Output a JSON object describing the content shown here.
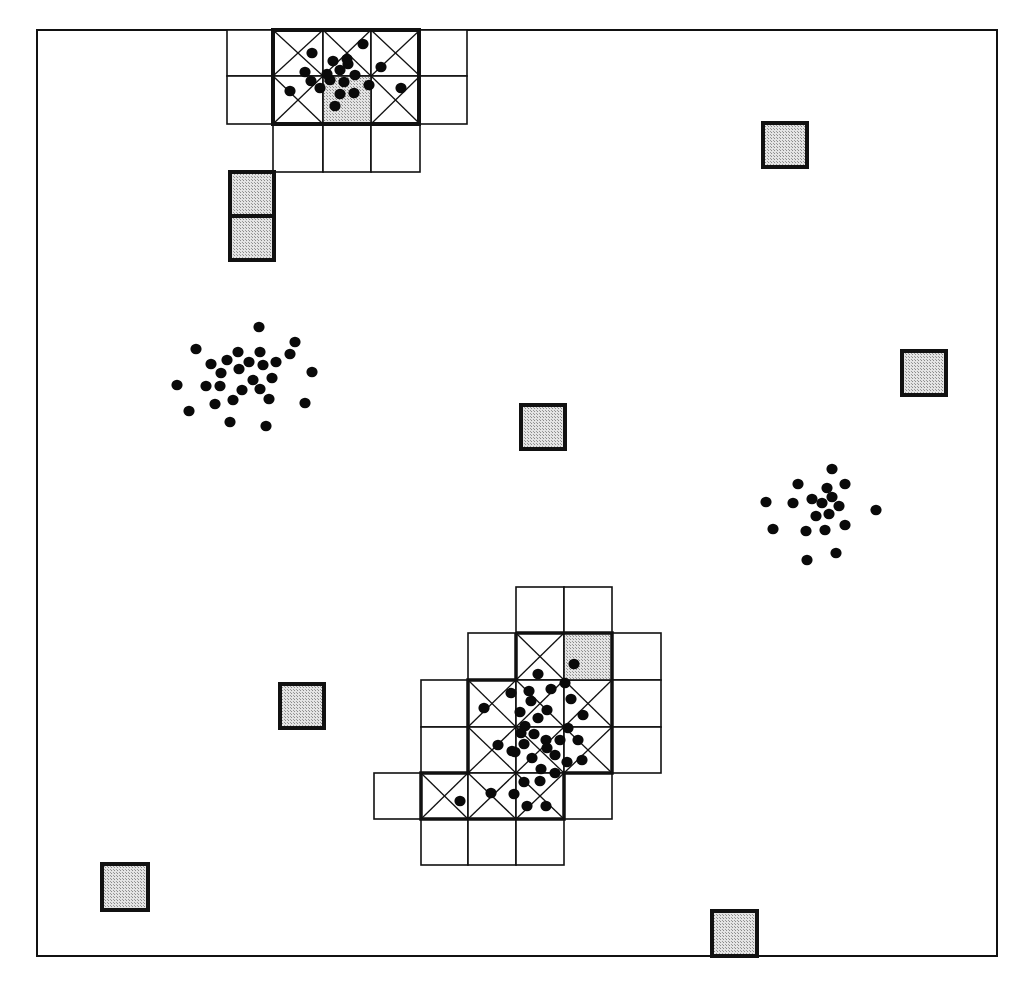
{
  "figure": {
    "type": "spatial grid clustering diagram",
    "frame": {
      "x": 37,
      "y": 30,
      "width": 960,
      "height": 926
    },
    "cell_size": 47,
    "colors": {
      "line": "#111111",
      "shaded_fill": "#c8c8c8",
      "dot": "#0a0a0a",
      "background": "#ffffff"
    },
    "legend_semantics": {
      "plain_cell": "neighbor grid cell",
      "crossed_cell": "dense cell (marked with X)",
      "shaded_cell": "shaded cell",
      "dot": "data point"
    }
  },
  "top_grid": {
    "plain_cells": [
      [
        227,
        30
      ],
      [
        227,
        76
      ],
      [
        420,
        30
      ],
      [
        420,
        76
      ],
      [
        273,
        124
      ],
      [
        323,
        124
      ],
      [
        371,
        124
      ]
    ],
    "crossed_cells": [
      [
        273,
        30
      ],
      [
        323,
        30
      ],
      [
        371,
        30
      ],
      [
        273,
        76
      ],
      [
        371,
        76
      ]
    ],
    "shaded_cells": [
      [
        323,
        76
      ]
    ],
    "cell_w": [
      46,
      50,
      48,
      49,
      47
    ],
    "thick_region": {
      "x": 273,
      "y": 30,
      "w": 146,
      "h": 94
    }
  },
  "bottom_grid": {
    "plain_cells": [
      [
        516,
        587
      ],
      [
        564,
        587
      ],
      [
        468,
        633
      ],
      [
        612,
        633
      ],
      [
        421,
        680
      ],
      [
        612,
        680
      ],
      [
        421,
        727
      ],
      [
        612,
        727
      ],
      [
        374,
        773
      ],
      [
        564,
        773
      ],
      [
        421,
        819
      ],
      [
        468,
        819
      ],
      [
        516,
        819
      ]
    ],
    "crossed_cells": [
      [
        516,
        633
      ],
      [
        468,
        680
      ],
      [
        516,
        680
      ],
      [
        564,
        680
      ],
      [
        468,
        727
      ],
      [
        516,
        727
      ],
      [
        564,
        727
      ],
      [
        421,
        773
      ],
      [
        468,
        773
      ],
      [
        516,
        773
      ]
    ],
    "shaded_cells": [
      [
        564,
        633
      ]
    ]
  },
  "isolated_shaded_squares": [
    {
      "x": 230,
      "y": 172,
      "size": 44
    },
    {
      "x": 230,
      "y": 216,
      "size": 44
    },
    {
      "x": 763,
      "y": 123,
      "size": 44
    },
    {
      "x": 902,
      "y": 351,
      "size": 44
    },
    {
      "x": 521,
      "y": 405,
      "size": 44
    },
    {
      "x": 280,
      "y": 684,
      "size": 44
    },
    {
      "x": 102,
      "y": 864,
      "size": 46
    },
    {
      "x": 712,
      "y": 911,
      "size": 45
    }
  ],
  "clusters": [
    {
      "name": "top-cluster",
      "points": [
        [
          312,
          53
        ],
        [
          363,
          44
        ],
        [
          305,
          72
        ],
        [
          333,
          61
        ],
        [
          348,
          64
        ],
        [
          340,
          70
        ],
        [
          381,
          67
        ],
        [
          355,
          75
        ],
        [
          330,
          80
        ],
        [
          369,
          85
        ],
        [
          311,
          81
        ],
        [
          320,
          88
        ],
        [
          290,
          91
        ],
        [
          340,
          94
        ],
        [
          354,
          93
        ],
        [
          401,
          88
        ],
        [
          335,
          106
        ],
        [
          344,
          82
        ],
        [
          327,
          74
        ],
        [
          347,
          59
        ]
      ]
    },
    {
      "name": "left-cluster",
      "points": [
        [
          259,
          327
        ],
        [
          196,
          349
        ],
        [
          295,
          342
        ],
        [
          238,
          352
        ],
        [
          260,
          352
        ],
        [
          227,
          360
        ],
        [
          211,
          364
        ],
        [
          249,
          362
        ],
        [
          290,
          354
        ],
        [
          276,
          362
        ],
        [
          221,
          373
        ],
        [
          239,
          369
        ],
        [
          263,
          365
        ],
        [
          312,
          372
        ],
        [
          177,
          385
        ],
        [
          206,
          386
        ],
        [
          220,
          386
        ],
        [
          253,
          380
        ],
        [
          272,
          378
        ],
        [
          242,
          390
        ],
        [
          260,
          389
        ],
        [
          189,
          411
        ],
        [
          215,
          404
        ],
        [
          233,
          400
        ],
        [
          269,
          399
        ],
        [
          305,
          403
        ],
        [
          230,
          422
        ],
        [
          266,
          426
        ]
      ]
    },
    {
      "name": "right-cluster",
      "points": [
        [
          832,
          469
        ],
        [
          798,
          484
        ],
        [
          827,
          488
        ],
        [
          845,
          484
        ],
        [
          812,
          499
        ],
        [
          832,
          497
        ],
        [
          766,
          502
        ],
        [
          793,
          503
        ],
        [
          822,
          503
        ],
        [
          839,
          506
        ],
        [
          876,
          510
        ],
        [
          816,
          516
        ],
        [
          829,
          514
        ],
        [
          845,
          525
        ],
        [
          773,
          529
        ],
        [
          806,
          531
        ],
        [
          825,
          530
        ],
        [
          836,
          553
        ],
        [
          807,
          560
        ]
      ]
    },
    {
      "name": "bottom-cluster",
      "points": [
        [
          574,
          664
        ],
        [
          538,
          674
        ],
        [
          565,
          683
        ],
        [
          511,
          693
        ],
        [
          529,
          691
        ],
        [
          551,
          689
        ],
        [
          484,
          708
        ],
        [
          531,
          701
        ],
        [
          520,
          712
        ],
        [
          547,
          710
        ],
        [
          571,
          699
        ],
        [
          538,
          718
        ],
        [
          525,
          726
        ],
        [
          583,
          715
        ],
        [
          521,
          733
        ],
        [
          534,
          734
        ],
        [
          546,
          740
        ],
        [
          568,
          728
        ],
        [
          498,
          745
        ],
        [
          512,
          751
        ],
        [
          524,
          744
        ],
        [
          547,
          748
        ],
        [
          560,
          740
        ],
        [
          578,
          740
        ],
        [
          532,
          758
        ],
        [
          555,
          755
        ],
        [
          567,
          762
        ],
        [
          541,
          769
        ],
        [
          582,
          760
        ],
        [
          524,
          782
        ],
        [
          555,
          773
        ],
        [
          491,
          793
        ],
        [
          460,
          801
        ],
        [
          514,
          794
        ],
        [
          527,
          806
        ],
        [
          546,
          806
        ],
        [
          540,
          781
        ],
        [
          515,
          752
        ]
      ]
    }
  ]
}
